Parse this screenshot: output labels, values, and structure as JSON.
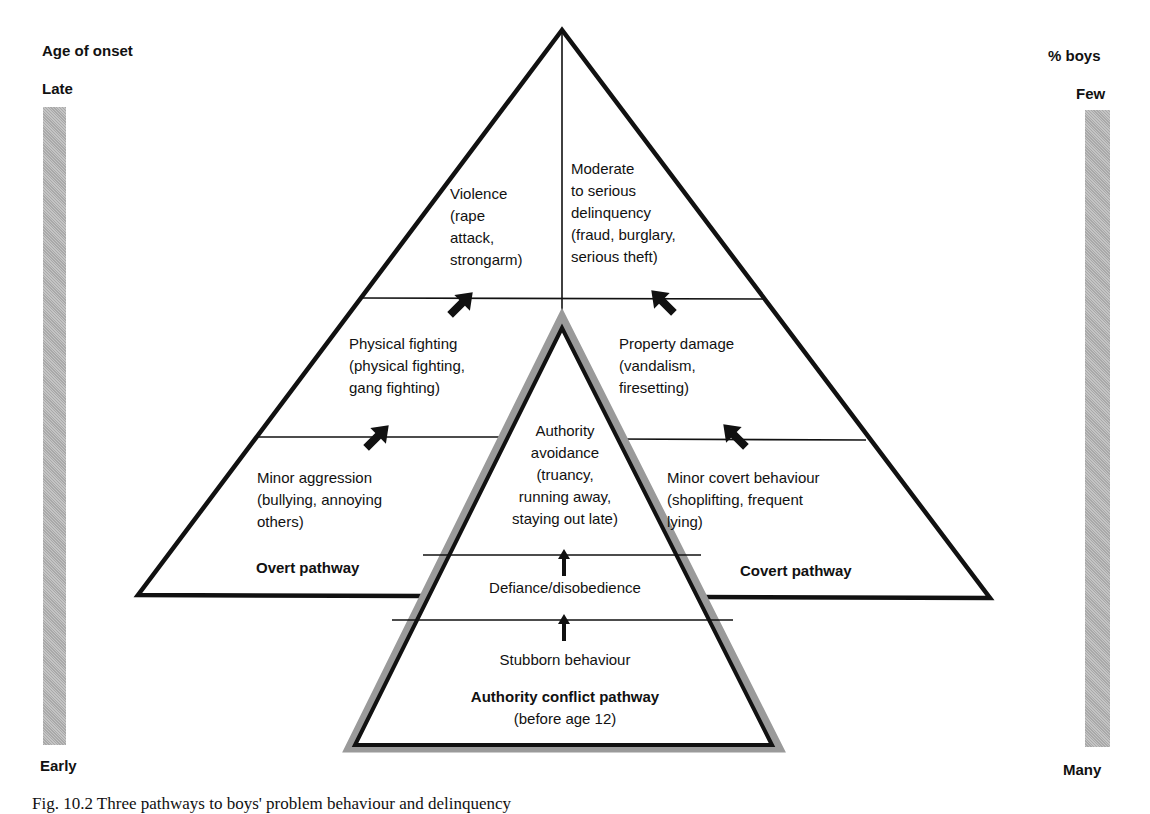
{
  "left_axis": {
    "title": "Age of onset",
    "top_label": "Late",
    "bottom_label": "Early"
  },
  "right_axis": {
    "title": "% boys",
    "top_label": "Few",
    "bottom_label": "Many"
  },
  "overt_pathway": {
    "title": "Overt pathway",
    "stages": [
      {
        "name": "Minor aggression",
        "examples": [
          "(bullying, annoying",
          "others)"
        ]
      },
      {
        "name": "Physical fighting",
        "examples": [
          "(physical fighting,",
          "gang fighting)"
        ]
      },
      {
        "name": "Violence",
        "examples": [
          "(rape",
          "attack,",
          "strongarm)"
        ]
      }
    ]
  },
  "covert_pathway": {
    "title": "Covert pathway",
    "stages": [
      {
        "name": "Minor covert behaviour",
        "examples": [
          "(shoplifting, frequent",
          "lying)"
        ]
      },
      {
        "name": "Property damage",
        "examples": [
          "(vandalism,",
          "firesetting)"
        ]
      },
      {
        "name": "Moderate",
        "examples": [
          "to serious",
          "delinquency",
          "(fraud, burglary,",
          "serious theft)"
        ]
      }
    ]
  },
  "authority_conflict_pathway": {
    "title": "Authority conflict pathway",
    "subtitle": "(before age 12)",
    "stages": [
      {
        "name": "Stubborn behaviour"
      },
      {
        "name": "Defiance/disobedience"
      },
      {
        "name": "Authority",
        "examples": [
          "avoidance",
          "(truancy,",
          "running away,",
          "staying out late)"
        ]
      }
    ]
  },
  "caption": "Fig. 10.2 Three pathways to boys' problem behaviour and delinquency",
  "colors": {
    "line": "#111111",
    "bar_fill": "#b8b8b8",
    "shadow": "#9a9a9a"
  }
}
